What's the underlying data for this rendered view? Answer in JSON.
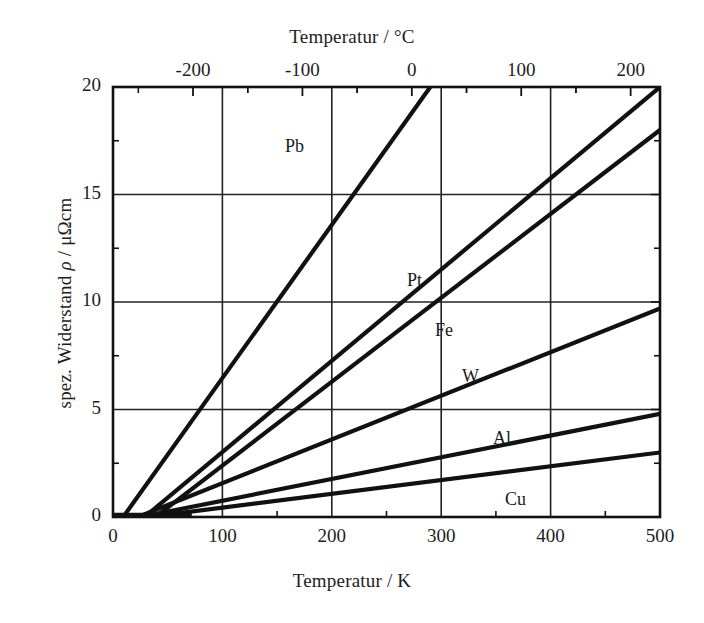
{
  "chart_data": {
    "type": "line",
    "title": "",
    "xlabel": "Temperatur / K",
    "xlabel_top": "Temperatur / °C",
    "ylabel": "spez. Widerstand ρ / μΩcm",
    "xlim": [
      0,
      500
    ],
    "ylim": [
      0,
      20
    ],
    "xticks": [
      "0",
      "100",
      "200",
      "300",
      "400",
      "500"
    ],
    "xtick_values": [
      0,
      100,
      200,
      300,
      400,
      500
    ],
    "xticks_top": [
      "-200",
      "-100",
      "0",
      "100",
      "200"
    ],
    "xtick_top_values": [
      -200,
      -100,
      0,
      100,
      200
    ],
    "yticks": [
      "0",
      "5",
      "10",
      "15",
      "20"
    ],
    "ytick_values": [
      0,
      5,
      10,
      15,
      20
    ],
    "minor_ticks": true,
    "grid": true,
    "legend": "inline-labels",
    "series": [
      {
        "name": "Pb",
        "label": "Pb",
        "label_x": 285,
        "label_y": 136,
        "x": [
          10,
          290
        ],
        "y": [
          0.05,
          20.0
        ]
      },
      {
        "name": "Pt",
        "label": "Pt",
        "label_x": 407,
        "label_y": 270,
        "x": [
          30,
          500
        ],
        "y": [
          0.05,
          20.0
        ]
      },
      {
        "name": "Fe",
        "label": "Fe",
        "label_x": 435,
        "label_y": 320,
        "x": [
          40,
          500
        ],
        "y": [
          0.05,
          18.0
        ]
      },
      {
        "name": "W",
        "label": "W",
        "label_x": 462,
        "label_y": 366,
        "x": [
          25,
          500
        ],
        "y": [
          0.05,
          9.7
        ]
      },
      {
        "name": "Al",
        "label": "Al",
        "label_x": 493,
        "label_y": 428,
        "x": [
          30,
          500
        ],
        "y": [
          0.05,
          4.8
        ]
      },
      {
        "name": "Cu",
        "label": "Cu",
        "label_x": 505,
        "label_y": 489,
        "x": [
          40,
          500
        ],
        "y": [
          0.05,
          3.0
        ]
      }
    ],
    "colors": {
      "line": "#111111",
      "axis": "#111111",
      "grid": "#222222",
      "background": "#ffffff"
    }
  },
  "geometry": {
    "left": 113,
    "right": 660,
    "top": 87,
    "bottom": 517
  }
}
